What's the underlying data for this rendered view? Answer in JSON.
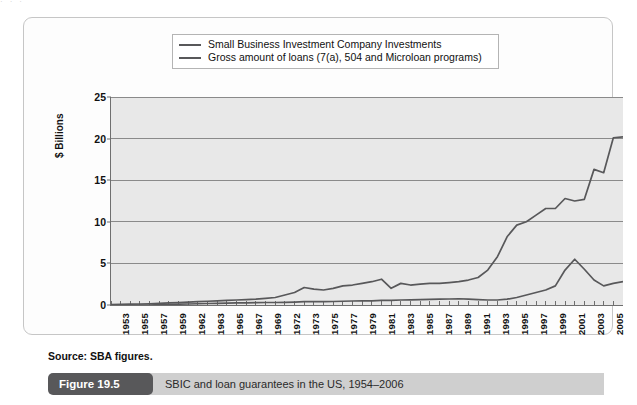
{
  "page_bleed": "· · ·",
  "legend": {
    "items": [
      {
        "label": "Small Business Investment Company Investments",
        "color": "#58585a"
      },
      {
        "label": "Gross amount of loans (7(a), 504 and Microloan programs)",
        "color": "#58585a"
      }
    ]
  },
  "source": "Source: SBA figures.",
  "caption": {
    "tag": "Figure 19.5",
    "text": "SBIC and loan guarantees in the US, 1954–2006"
  },
  "chart_data": {
    "type": "line",
    "title": "SBIC and loan guarantees in the US, 1954–2006",
    "xlabel": "",
    "ylabel": "$ Billions",
    "ylim": [
      0,
      25
    ],
    "yticks": [
      0,
      5,
      10,
      15,
      20,
      25
    ],
    "grid": true,
    "legend_position": "top",
    "xlim": [
      1953,
      2006
    ],
    "tick_labels": [
      "1953",
      "1955",
      "1957",
      "1959",
      "1962",
      "1963",
      "1965",
      "1967",
      "1969",
      "1972",
      "1973",
      "1975",
      "1977",
      "1979",
      "1981",
      "1983",
      "1985",
      "1987",
      "1989",
      "1991",
      "1993",
      "1995",
      "1997",
      "1999",
      "2001",
      "2003",
      "2005"
    ],
    "x": [
      1953,
      1954,
      1955,
      1956,
      1957,
      1958,
      1959,
      1960,
      1961,
      1962,
      1963,
      1964,
      1965,
      1966,
      1967,
      1968,
      1969,
      1970,
      1971,
      1972,
      1973,
      1974,
      1975,
      1976,
      1977,
      1978,
      1979,
      1980,
      1981,
      1982,
      1983,
      1984,
      1985,
      1986,
      1987,
      1988,
      1989,
      1990,
      1991,
      1992,
      1993,
      1994,
      1995,
      1996,
      1997,
      1998,
      1999,
      2000,
      2001,
      2002,
      2003,
      2004,
      2005,
      2006
    ],
    "series": [
      {
        "name": "Small Business Investment Company Investments",
        "color": "#58585a",
        "values": [
          0,
          0,
          0,
          0,
          0,
          0.05,
          0.08,
          0.1,
          0.12,
          0.15,
          0.18,
          0.2,
          0.22,
          0.25,
          0.25,
          0.28,
          0.3,
          0.3,
          0.32,
          0.35,
          0.4,
          0.4,
          0.4,
          0.42,
          0.45,
          0.48,
          0.5,
          0.5,
          0.55,
          0.55,
          0.6,
          0.62,
          0.65,
          0.68,
          0.7,
          0.72,
          0.75,
          0.7,
          0.65,
          0.6,
          0.6,
          0.7,
          0.9,
          1.2,
          1.5,
          1.8,
          2.3,
          4.2,
          5.5,
          4.3,
          3.0,
          2.3,
          2.6,
          2.8
        ]
      },
      {
        "name": "Gross amount of loans (7(a), 504 and Microloan programs)",
        "color": "#58585a",
        "values": [
          0.05,
          0.08,
          0.1,
          0.12,
          0.15,
          0.2,
          0.25,
          0.3,
          0.35,
          0.4,
          0.45,
          0.5,
          0.55,
          0.6,
          0.65,
          0.7,
          0.8,
          0.9,
          1.2,
          1.5,
          2.1,
          1.9,
          1.8,
          2.0,
          2.3,
          2.4,
          2.6,
          2.8,
          3.1,
          2.0,
          2.6,
          2.4,
          2.5,
          2.6,
          2.6,
          2.7,
          2.8,
          3.0,
          3.3,
          4.2,
          5.8,
          8.2,
          9.6,
          10.0,
          10.8,
          11.6,
          11.6,
          12.8,
          12.5,
          12.7,
          16.3,
          15.9,
          20.1,
          20.2
        ]
      }
    ]
  }
}
